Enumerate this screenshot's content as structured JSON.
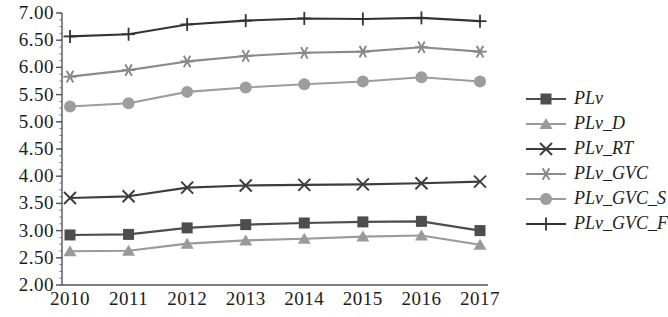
{
  "chart_data": {
    "type": "line",
    "title": "",
    "xlabel": "",
    "ylabel": "",
    "categories": [
      "2010",
      "2011",
      "2012",
      "2013",
      "2014",
      "2015",
      "2016",
      "2017"
    ],
    "ylim": [
      2.0,
      7.0
    ],
    "ytick_step": 0.5,
    "yticks": [
      "2.00",
      "2.50",
      "3.00",
      "3.50",
      "4.00",
      "4.50",
      "5.00",
      "5.50",
      "6.00",
      "6.50",
      "7.00"
    ],
    "grid": false,
    "legend_position": "right",
    "series": [
      {
        "name": "PLv",
        "marker": "square",
        "color": "#4d4d4d",
        "values": [
          2.92,
          2.93,
          3.05,
          3.11,
          3.14,
          3.16,
          3.17,
          3.0
        ]
      },
      {
        "name": "PLv_D",
        "marker": "triangle",
        "color": "#9a9a9a",
        "values": [
          2.62,
          2.63,
          2.76,
          2.82,
          2.85,
          2.89,
          2.91,
          2.74
        ]
      },
      {
        "name": "PLv_RT",
        "marker": "x",
        "color": "#3d3d3d",
        "values": [
          3.6,
          3.63,
          3.79,
          3.83,
          3.84,
          3.85,
          3.87,
          3.9
        ]
      },
      {
        "name": "PLv_GVC",
        "marker": "asterisk",
        "color": "#8a8a8a",
        "values": [
          5.83,
          5.95,
          6.11,
          6.21,
          6.27,
          6.29,
          6.37,
          6.29
        ]
      },
      {
        "name": "PLv_GVC_S",
        "marker": "circle",
        "color": "#9d9d9d",
        "values": [
          5.28,
          5.34,
          5.55,
          5.63,
          5.69,
          5.74,
          5.82,
          5.74
        ]
      },
      {
        "name": "PLv_GVC_F",
        "marker": "plus",
        "color": "#333333",
        "values": [
          6.57,
          6.61,
          6.79,
          6.86,
          6.9,
          6.89,
          6.91,
          6.85
        ]
      }
    ]
  },
  "axes": {
    "axis_color": "#555555"
  }
}
